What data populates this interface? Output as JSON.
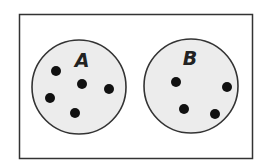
{
  "diagram": {
    "type": "venn-disjoint-sets",
    "universe": {
      "x": 19,
      "y": 14,
      "width": 233,
      "height": 144,
      "border": "#333333",
      "fill": "#ffffff"
    },
    "sets": [
      {
        "label": "A",
        "cx": 79,
        "cy": 87,
        "r": 47,
        "fill": "#ececec",
        "stroke": "#333333",
        "label_pos": {
          "x": 82,
          "y": 67
        },
        "elements": [
          {
            "x": 56,
            "y": 71
          },
          {
            "x": 82,
            "y": 84
          },
          {
            "x": 50,
            "y": 98
          },
          {
            "x": 75,
            "y": 113
          },
          {
            "x": 109,
            "y": 89
          }
        ]
      },
      {
        "label": "B",
        "cx": 191,
        "cy": 86,
        "r": 47,
        "fill": "#ececec",
        "stroke": "#333333",
        "label_pos": {
          "x": 190,
          "y": 65
        },
        "elements": [
          {
            "x": 176,
            "y": 82
          },
          {
            "x": 227,
            "y": 87
          },
          {
            "x": 184,
            "y": 109
          },
          {
            "x": 215,
            "y": 114
          }
        ]
      }
    ],
    "dot_radius": 5,
    "dot_color": "#111111"
  }
}
